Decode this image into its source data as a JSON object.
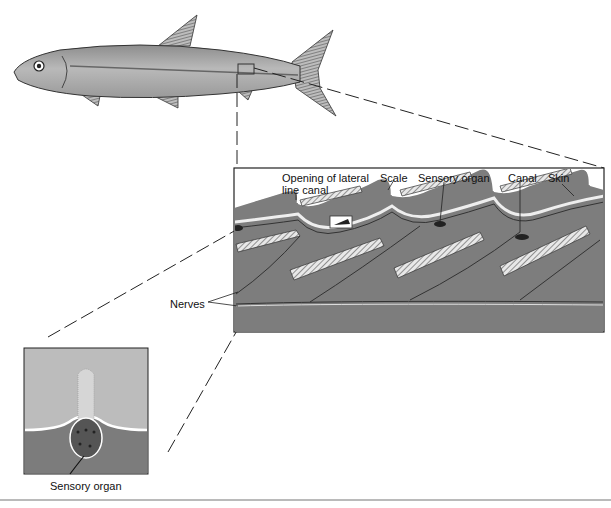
{
  "figure": {
    "labels": {
      "opening": "Opening of lateral",
      "opening_line2": "line canal",
      "scale": "Scale",
      "sensory_organ": "Sensory organ",
      "canal": "Canal",
      "skin": "Skin",
      "nerves": "Nerves"
    },
    "inset_caption": "Sensory organ",
    "colors": {
      "fish_body": "#a9a9a9",
      "panel_tissue": "#7a7a7a",
      "panel_background": "#ffffff",
      "inset_water": "#bdbdbd",
      "inset_tissue": "#7c7c7c",
      "line": "#222222"
    }
  }
}
